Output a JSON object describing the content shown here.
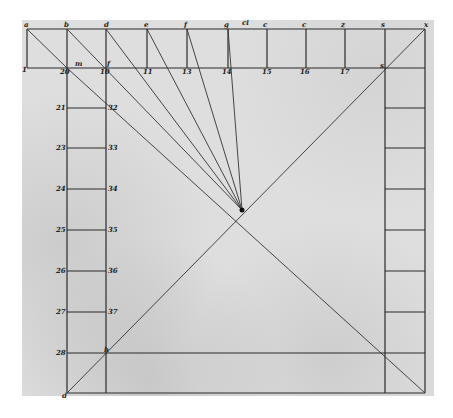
{
  "figure": {
    "top_letters": [
      "a",
      "b",
      "d",
      "e",
      "f",
      "g",
      "ci",
      "c",
      "c",
      "z",
      "s",
      "x"
    ],
    "top_row_numbers": [
      "1",
      "20",
      "10",
      "11",
      "13",
      "14",
      "15",
      "16",
      "17"
    ],
    "point_labels": {
      "m": "m",
      "f": "f",
      "s": "s",
      "h": "h",
      "d": "d"
    },
    "left_outer_numbers": [
      "21",
      "23",
      "24",
      "25",
      "26",
      "27",
      "28"
    ],
    "left_inner_numbers": [
      "32",
      "33",
      "34",
      "35",
      "36",
      "37"
    ],
    "colors": {
      "ink": "#222222",
      "paper": "#dedede"
    }
  }
}
